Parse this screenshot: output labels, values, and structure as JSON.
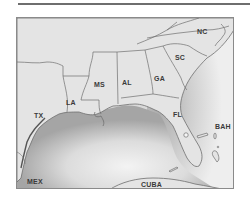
{
  "map": {
    "title": "",
    "region": "Southeastern United States and Gulf of Mexico",
    "colors": {
      "land": "#e4e4e4",
      "water_dark": "#a9a9a9",
      "water_light": "#f2f2f2",
      "border": "#6f6f6f",
      "label": "#3a3a3a"
    },
    "labels": {
      "nc": "NC",
      "sc": "SC",
      "ga": "GA",
      "al": "AL",
      "ms": "MS",
      "la": "LA",
      "tx": "TX",
      "fl": "FL",
      "bah": "BAH",
      "mex": "MEX",
      "cuba": "CUBA"
    }
  }
}
